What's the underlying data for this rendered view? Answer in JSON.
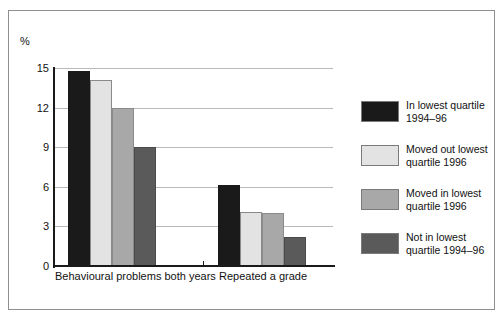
{
  "chart_data": {
    "type": "bar",
    "title": "",
    "subtitle": "",
    "xlabel": "",
    "ylabel": "%",
    "ylim": [
      0,
      15
    ],
    "yticks": [
      "0",
      "3",
      "6",
      "9",
      "12",
      "15"
    ],
    "ytick_values": [
      0,
      3,
      6,
      9,
      12,
      15
    ],
    "grid": true,
    "legend_position": "right",
    "categories": [
      "Behavioural problems both years",
      "Repeated a grade"
    ],
    "series": [
      {
        "name": "In lowest quartile 1994–96",
        "legend_line_1": "In lowest quartile",
        "legend_line_2": "1994–96",
        "color": "#1a1a1a",
        "values": [
          14.8,
          6.1
        ]
      },
      {
        "name": "Moved out lowest quartile 1996",
        "legend_line_1": "Moved out lowest",
        "legend_line_2": "quartile 1996",
        "color": "#e3e3e3",
        "values": [
          14.1,
          4.1
        ]
      },
      {
        "name": "Moved in lowest quartile 1996",
        "legend_line_1": "Moved in lowest",
        "legend_line_2": "quartile 1996",
        "color": "#a8a8a8",
        "values": [
          12.0,
          4.0
        ]
      },
      {
        "name": "Not in lowest quartile 1994–96",
        "legend_line_1": "Not in lowest",
        "legend_line_2": "quartile 1994–96",
        "color": "#5a5a5a",
        "values": [
          9.0,
          2.2
        ]
      }
    ]
  }
}
